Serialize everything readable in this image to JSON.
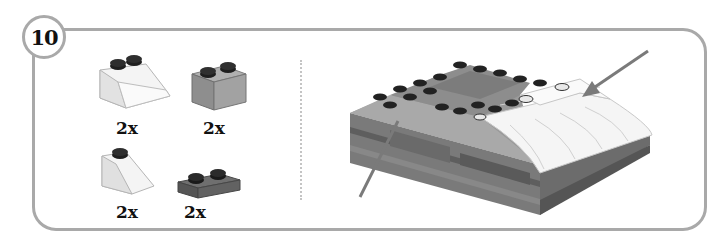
{
  "step": {
    "number": "10"
  },
  "parts_list": {
    "items": [
      {
        "name": "slope-2x2-white",
        "quantity": "2x",
        "color": "#f2f2f2"
      },
      {
        "name": "brick-1x2-gray",
        "quantity": "2x",
        "color": "#9a9a9a"
      },
      {
        "name": "slope-1x2-white",
        "quantity": "2x",
        "color": "#f2f2f2"
      },
      {
        "name": "plate-1x2-dark-gray",
        "quantity": "2x",
        "color": "#6e6e6e"
      }
    ]
  },
  "assembly": {
    "arrows": [
      {
        "name": "arrow-right-top",
        "color": "#7a7a7a"
      },
      {
        "name": "arrow-left-bottom",
        "color": "#7a7a7a"
      }
    ]
  },
  "colors": {
    "frame": "#a9a9a9",
    "divider": "#c4c4c4"
  }
}
